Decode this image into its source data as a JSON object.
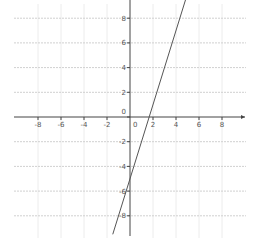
{
  "chart_data": {
    "type": "line",
    "title": "",
    "xlabel": "",
    "ylabel": "",
    "xlim": [
      -10,
      10
    ],
    "ylim": [
      -9.5,
      9.5
    ],
    "grid": true,
    "x_ticks": [
      -8,
      -6,
      -4,
      -2,
      0,
      2,
      4,
      6,
      8
    ],
    "y_ticks": [
      -8,
      -6,
      -4,
      -2,
      0,
      2,
      4,
      6,
      8
    ],
    "series": [
      {
        "name": "y = 3x - 5",
        "equation": "y = 3x - 5",
        "slope": 3,
        "intercept": -5,
        "x": [
          -1.5,
          0,
          1.67,
          5
        ],
        "y": [
          -9.5,
          -5,
          0,
          10
        ],
        "color": "#555555"
      }
    ],
    "origin_label": "0"
  },
  "style": {
    "axis_color": "#444444",
    "grid_color": "#d0d0d0",
    "line_color": "#555555"
  }
}
